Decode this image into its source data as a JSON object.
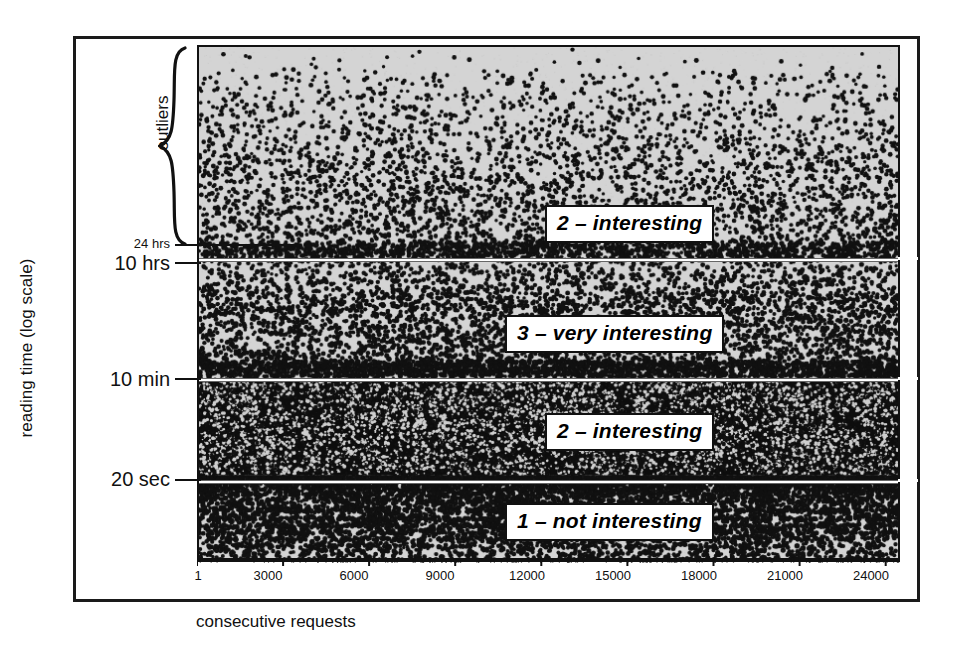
{
  "figure": {
    "background_color": "#ffffff",
    "plot_background_color": "#d4d4d4",
    "ink_color": "#000000"
  },
  "chart_data": {
    "type": "scatter",
    "title": "",
    "subtitle": "",
    "xlabel": "consecutive requests",
    "ylabel": "reading time (log scale)",
    "y_scale": "log",
    "grid": false,
    "legend_position": "none",
    "xlim": [
      1,
      24500
    ],
    "x_ticks": [
      {
        "label": "1",
        "value": 1
      },
      {
        "label": "3000",
        "value": 3000
      },
      {
        "label": "6000",
        "value": 6000
      },
      {
        "label": "9000",
        "value": 9000
      },
      {
        "label": "12000",
        "value": 12000
      },
      {
        "label": "15000",
        "value": 15000
      },
      {
        "label": "18000",
        "value": 18000
      },
      {
        "label": "21000",
        "value": 21000
      },
      {
        "label": "24000",
        "value": 24000
      }
    ],
    "y_ticks": [
      {
        "label": "24 hrs",
        "size": "small",
        "y_frac": 0.383
      },
      {
        "label": "10 hrs",
        "size": "big",
        "y_frac": 0.42
      },
      {
        "label": "10 min",
        "size": "big",
        "y_frac": 0.643
      },
      {
        "label": "20 sec",
        "size": "big",
        "y_frac": 0.839
      }
    ],
    "annotations": [
      {
        "name": "outliers-brace",
        "label": "outliers",
        "y_frac_top": 0.0,
        "y_frac_bottom": 0.385
      }
    ],
    "bands": [
      {
        "id": "band-outliers-interesting",
        "label": "2 – interesting",
        "y_frac_top": 0.0,
        "y_frac_bottom": 0.42,
        "density": "sparse",
        "description": "scattered outlier points above 10 hrs, densest near the 24 hrs line"
      },
      {
        "id": "band-very-interesting",
        "label": "3 – very interesting",
        "y_frac_top": 0.42,
        "y_frac_bottom": 0.643,
        "density": "medium",
        "description": "moderate density between 10 hrs and 10 min"
      },
      {
        "id": "band-interesting",
        "label": "2 – interesting",
        "y_frac_top": 0.643,
        "y_frac_bottom": 0.839,
        "density": "saturated",
        "description": "near-solid black band between 10 min and 20 sec"
      },
      {
        "id": "band-not-interesting",
        "label": "1 – not interesting",
        "y_frac_top": 0.839,
        "y_frac_bottom": 1.0,
        "density": "gradient",
        "description": "dense at top fading to sparse rows of dots toward the bottom, below 20 sec"
      }
    ],
    "region_labels": [
      {
        "text": "2 – interesting",
        "band": "band-outliers-interesting",
        "x_frac": 0.55,
        "y_frac": 0.335
      },
      {
        "text": "3 – very interesting",
        "band": "band-very-interesting",
        "x_frac": 0.51,
        "y_frac": 0.565
      },
      {
        "text": "2 – interesting",
        "band": "band-interesting",
        "x_frac": 0.55,
        "y_frac": 0.755
      },
      {
        "text": "1 – not interesting",
        "band": "band-not-interesting",
        "x_frac": 0.51,
        "y_frac": 0.925
      }
    ]
  }
}
